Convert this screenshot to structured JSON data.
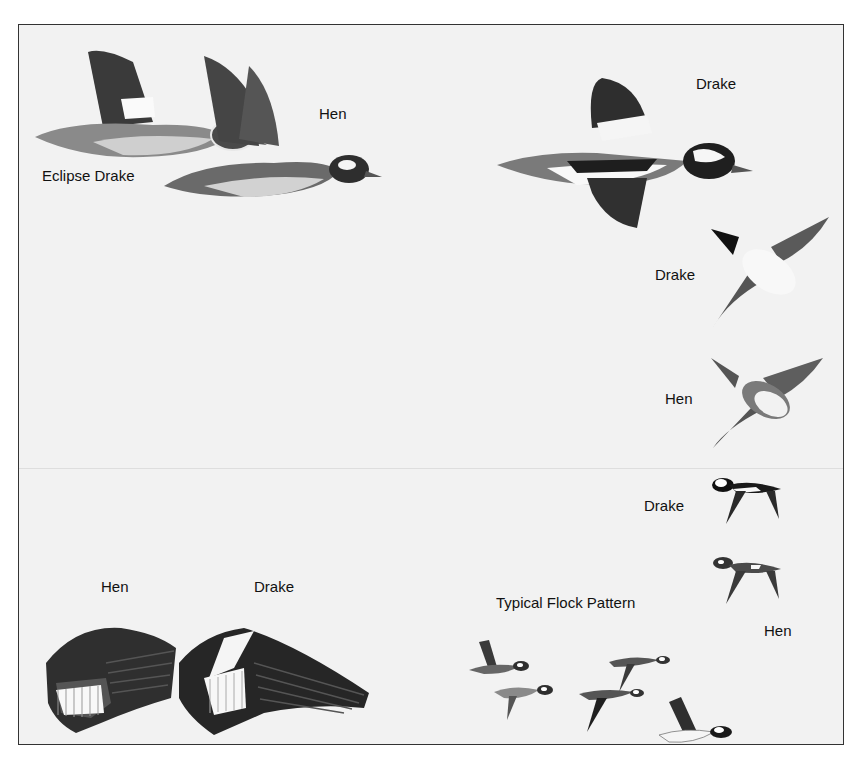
{
  "plate": {
    "background": "#f2f2f2",
    "border_color": "#333333",
    "labels": {
      "top_left_hen": "Hen",
      "eclipse_drake": "Eclipse Drake",
      "top_right_drake": "Drake",
      "underside_drake": "Drake",
      "underside_hen": "Hen",
      "small_drake": "Drake",
      "small_hen": "Hen",
      "wing_hen": "Hen",
      "wing_drake": "Drake",
      "flock": "Typical Flock Pattern"
    }
  },
  "illustrations": [
    {
      "id": "eclipse-drake-side",
      "subject": "Eclipse Drake, side view in flight"
    },
    {
      "id": "hen-side",
      "subject": "Hen, side view in flight"
    },
    {
      "id": "drake-side",
      "subject": "Drake, side view in flight"
    },
    {
      "id": "drake-underside",
      "subject": "Drake, underside view"
    },
    {
      "id": "hen-underside",
      "subject": "Hen, underside view"
    },
    {
      "id": "drake-small",
      "subject": "Drake, small side silhouette"
    },
    {
      "id": "hen-small",
      "subject": "Hen, small side silhouette"
    },
    {
      "id": "hen-wing",
      "subject": "Hen wing"
    },
    {
      "id": "drake-wing",
      "subject": "Drake wing"
    },
    {
      "id": "flock",
      "subject": "Typical flock pattern, six birds"
    }
  ]
}
